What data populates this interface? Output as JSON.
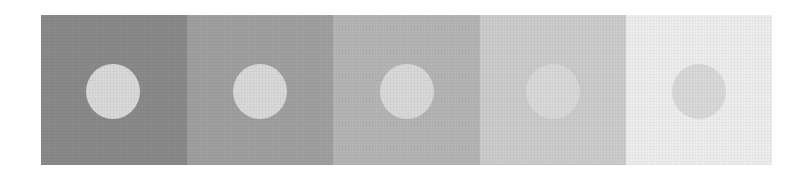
{
  "figure": {
    "title": "",
    "disc_color": "#d9d9d9",
    "panels": [
      {
        "index": 1,
        "background": "#8a8a8a",
        "disc": "#d9d9d9",
        "width": 146,
        "disc_left": 45
      },
      {
        "index": 2,
        "background": "#a0a0a0",
        "disc": "#d9d9d9",
        "width": 146,
        "disc_left": 46
      },
      {
        "index": 3,
        "background": "#b5b5b5",
        "disc": "#d9d9d9",
        "width": 147,
        "disc_left": 47
      },
      {
        "index": 4,
        "background": "#cccccc",
        "disc": "#d9d9d9",
        "width": 146,
        "disc_left": 46
      },
      {
        "index": 5,
        "background": "#eeeeee",
        "disc": "#d9d9d9",
        "width": 146,
        "disc_left": 46
      }
    ]
  }
}
